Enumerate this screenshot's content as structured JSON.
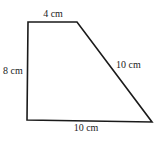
{
  "figure": {
    "shape": "right trapezoid",
    "stroke_color": "#1a1a1a",
    "vertices": {
      "top_left": [
        28,
        22
      ],
      "top_right": [
        77,
        22
      ],
      "bottom_right": [
        152,
        122
      ],
      "bottom_left": [
        27,
        120
      ]
    },
    "labels": {
      "top": "4 cm",
      "left": "8 cm",
      "slant": "10 cm",
      "bottom": "10 cm"
    }
  }
}
